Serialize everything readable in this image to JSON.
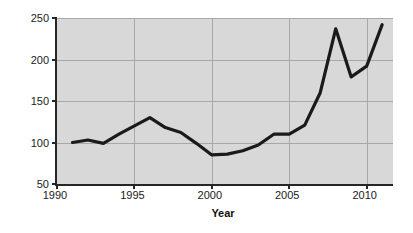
{
  "chart_data": {
    "type": "line",
    "title": "",
    "subtitle": "",
    "xlabel": "Year",
    "ylabel": "Global Consumption Price Index",
    "xlim": [
      1990,
      2011.7
    ],
    "ylim": [
      50,
      250
    ],
    "xticks": [
      1990,
      1995,
      2000,
      2005,
      2010
    ],
    "xtick_labels": [
      "1990",
      "1995",
      "2000",
      "2005",
      "2010"
    ],
    "yticks": [
      50,
      100,
      150,
      200,
      250
    ],
    "ytick_labels": [
      "50",
      "100",
      "150",
      "200",
      "250"
    ],
    "grid": true,
    "grid_color": "#a8a8a8",
    "plot_background": "#d8d8d8",
    "figure_background": "#ffffff",
    "legend": null,
    "series": [
      {
        "name": "Global Consumption Price Index",
        "color": "#1a1a1a",
        "line_width": 3.2,
        "x": [
          1991,
          1992,
          1993,
          1994,
          1995,
          1996,
          1997,
          1998,
          1999,
          2000,
          2001,
          2002,
          2003,
          2004,
          2005,
          2006,
          2007,
          2008,
          2009,
          2010,
          2011
        ],
        "values": [
          100,
          103,
          99,
          110,
          120,
          130,
          118,
          112,
          99,
          85,
          86,
          90,
          97,
          110,
          110,
          121,
          160,
          237,
          179,
          192,
          242
        ]
      }
    ]
  },
  "axes": {
    "y_title": "Global Consumption Price Index",
    "x_title": "Year"
  }
}
